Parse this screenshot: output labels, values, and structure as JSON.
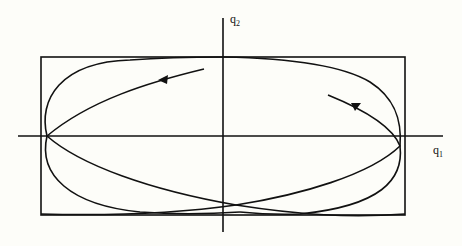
{
  "figure": {
    "type": "phase-plane trajectory (Lissajous-like curve in bounding rectangle)",
    "axes": {
      "x_label": "q",
      "x_label_sub": "1",
      "y_label": "q",
      "y_label_sub": "2"
    },
    "colors": {
      "stroke": "#111111",
      "background": "#fdfdf9"
    },
    "arrows": [
      {
        "position": "upper-left branch",
        "direction": "left"
      },
      {
        "position": "upper-right branch",
        "direction": "up-left"
      }
    ]
  }
}
